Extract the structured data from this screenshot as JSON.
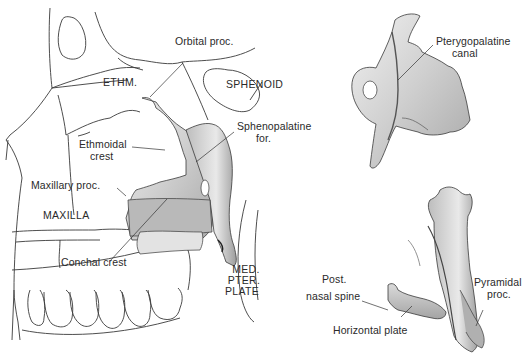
{
  "figure": {
    "views": [
      {
        "id": "in-situ-lateral",
        "labels": {
          "orbital_proc": "Orbital proc.",
          "ethm": "ETHM.",
          "sphenoid": "SPHENOID",
          "sphenopalatine_line1": "Sphenopalatine",
          "sphenopalatine_line2": "for.",
          "ethmoidal_line1": "Ethmoidal",
          "ethmoidal_line2": "crest",
          "maxillary_proc": "Maxillary proc.",
          "maxilla": "MAXILLA",
          "conchal_crest": "Conchal crest",
          "med_line1": "MED.",
          "med_line2": "PTER.",
          "med_line3": "PLATE"
        }
      },
      {
        "id": "isolated-oblique",
        "labels": {
          "pterygopalatine_line1": "Pterygopalatine",
          "pterygopalatine_line2": "canal"
        }
      },
      {
        "id": "isolated-posterior",
        "labels": {
          "post_line1": "Post.",
          "post_line2": "nasal spine",
          "horizontal_plate": "Horizontal plate",
          "pyramidal_line1": "Pyramidal",
          "pyramidal_line2": "proc."
        }
      }
    ],
    "colors": {
      "ink": "#2a2a2a",
      "bone_shade": "#c8c8c8",
      "bone_light": "#e6e6e6",
      "background": "#ffffff"
    }
  }
}
